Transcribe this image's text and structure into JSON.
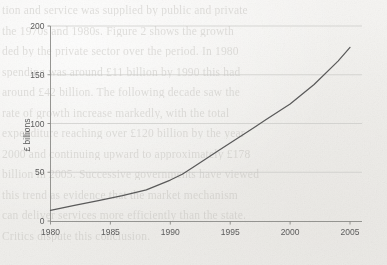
{
  "document": {
    "type": "scanned-page-figure",
    "background_texts": [
      "tion and service was supplied by public and private",
      "the 1970s and 1980s. Figure 2 shows the growth",
      "ded by the private sector over the period. In 1980",
      "spending was around £11 billion by 1990 this had",
      "around £42 billion. The following decade saw the",
      "rate of growth increase markedly, with the total",
      "expenditure reaching over £120 billion by the year",
      "2000 and continuing upward to approximately £178",
      "billion in 2005. Successive governments have viewed",
      "this trend as evidence that the market mechanism",
      "can deliver services more efficiently than the state.",
      "Critics dispute this conclusion."
    ]
  },
  "chart_data": {
    "type": "line",
    "title": "",
    "xlabel": "",
    "ylabel": "£ billions",
    "xlim": [
      1980,
      2006
    ],
    "ylim": [
      0,
      200
    ],
    "ytick_values": [
      0,
      50,
      100,
      150,
      200
    ],
    "ytick_labels": [
      "0",
      "50",
      "100",
      "150",
      "200"
    ],
    "xtick_values": [
      1980,
      1985,
      1990,
      1995,
      2000,
      2005
    ],
    "xtick_labels": [
      "1980",
      "1985",
      "1990",
      "1995",
      "2000",
      "2005"
    ],
    "grid": "horizontal",
    "legend": "none",
    "line_color": "#5a5a5a",
    "series": [
      {
        "name": "Private sector expenditure",
        "x": [
          1980,
          1982,
          1984,
          1986,
          1988,
          1990,
          1991,
          1992,
          1994,
          1996,
          1997,
          1998,
          2000,
          2002,
          2004,
          2005
        ],
        "values": [
          11,
          16,
          21,
          26,
          32,
          42,
          48,
          56,
          72,
          88,
          96,
          104,
          120,
          140,
          164,
          178
        ]
      }
    ]
  },
  "axes": {
    "y_axis_name": "y-axis",
    "x_axis_name": "x-axis"
  }
}
